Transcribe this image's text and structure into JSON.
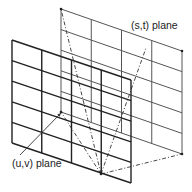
{
  "diagram": {
    "labels": {
      "st_plane": "(s,t) plane",
      "uv_plane": "(u,v) plane"
    },
    "colors": {
      "back_plane": "#555555",
      "front_plane": "#222222",
      "rays": "#333333",
      "background": "#ffffff"
    },
    "planes": [
      {
        "name": "(s,t) plane",
        "position": "back",
        "corners": [
          [
            61,
            9
          ],
          [
            182,
            51
          ],
          [
            182,
            154
          ],
          [
            61,
            112
          ]
        ],
        "columns": 4,
        "rows": 5
      },
      {
        "name": "(u,v) plane",
        "position": "front",
        "corners": [
          [
            12,
            40
          ],
          [
            131,
            80
          ],
          [
            131,
            183
          ],
          [
            12,
            143
          ]
        ],
        "columns": 4,
        "rows": 5
      }
    ],
    "convergence_point": [
      101,
      174
    ],
    "rays": [
      {
        "from": [
          101,
          174
        ],
        "to": [
          61,
          9
        ],
        "style": "dash-dot"
      },
      {
        "from": [
          101,
          174
        ],
        "to": [
          182,
          154
        ],
        "style": "dash-dot"
      },
      {
        "from": [
          101,
          174
        ],
        "to": [
          61,
          112
        ],
        "style": "dash-dot"
      },
      {
        "from": [
          101,
          174
        ],
        "to": [
          146,
          48
        ],
        "style": "dash-dot"
      }
    ],
    "pointer": {
      "from": [
        20,
        155
      ],
      "to": [
        61,
        113
      ],
      "target": "(u,v) plane"
    }
  }
}
